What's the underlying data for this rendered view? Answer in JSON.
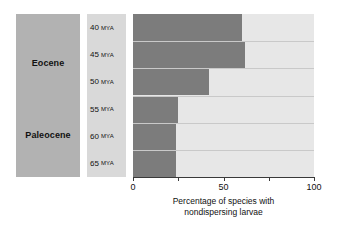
{
  "chart_data": {
    "type": "bar",
    "orientation": "horizontal",
    "title": "",
    "xlabel": "Percentage of species with nondispersing larvae",
    "xlabel_lines": [
      "Percentage of species with",
      "nondispersing larvae"
    ],
    "ylabel": "",
    "xlim": [
      0,
      100
    ],
    "xticks": [
      0,
      25,
      50,
      75,
      100
    ],
    "xtick_labels": [
      "0",
      "",
      "50",
      "",
      "100"
    ],
    "grid": false,
    "legend": "none",
    "categories": [
      "40 MYA",
      "45 MYA",
      "50 MYA",
      "55 MYA",
      "60 MYA",
      "65 MYA"
    ],
    "values": [
      60,
      62,
      42,
      25,
      24,
      24
    ],
    "series": [
      {
        "name": "Percentage of species with nondispersing larvae",
        "values": [
          60,
          62,
          42,
          25,
          24,
          24
        ]
      }
    ],
    "bar_color": "#7c7c7c",
    "track_color": "#e7e7e7"
  },
  "epochs": {
    "panel_color": "#b2b2b2",
    "items": [
      {
        "label": "Eocene"
      },
      {
        "label": "Paleocene"
      }
    ]
  },
  "age_axis": {
    "column_color": "#d9d9d9",
    "unit": "MYA",
    "rows": [
      {
        "value": "40",
        "unit": "MYA"
      },
      {
        "value": "45",
        "unit": "MYA"
      },
      {
        "value": "50",
        "unit": "MYA"
      },
      {
        "value": "55",
        "unit": "MYA"
      },
      {
        "value": "60",
        "unit": "MYA"
      },
      {
        "value": "65",
        "unit": "MYA"
      }
    ]
  },
  "x_axis": {
    "ticks": [
      {
        "value": "0",
        "pos": 0
      },
      {
        "value": "",
        "pos": 25
      },
      {
        "value": "50",
        "pos": 50
      },
      {
        "value": "",
        "pos": 75
      },
      {
        "value": "100",
        "pos": 100
      }
    ],
    "title_line1": "Percentage of species with",
    "title_line2": "nondispersing larvae"
  }
}
